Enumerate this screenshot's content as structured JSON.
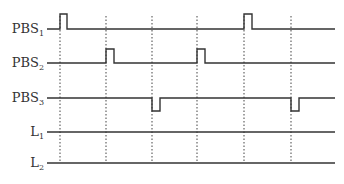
{
  "diagram": {
    "type": "timing_diagram",
    "line_color": "#333333",
    "time_markers_x": [
      60,
      106,
      152,
      197,
      244,
      291
    ],
    "grid_bottom_y": 163,
    "signals": [
      {
        "name": "PBS",
        "sub": "1",
        "base_y": 29,
        "kind": "pulse_high",
        "amplitude": 15,
        "pulses": [
          [
            60,
            67
          ],
          [
            244,
            252
          ]
        ]
      },
      {
        "name": "PBS",
        "sub": "2",
        "base_y": 63,
        "kind": "pulse_high",
        "amplitude": 14,
        "pulses": [
          [
            106,
            114
          ],
          [
            197,
            205
          ]
        ]
      },
      {
        "name": "PBS",
        "sub": "3",
        "base_y": 98,
        "kind": "pulse_low",
        "amplitude": 13,
        "pulses": [
          [
            152,
            160
          ],
          [
            291,
            299
          ]
        ]
      },
      {
        "name": "L",
        "sub": "1",
        "base_y": 132,
        "kind": "flat",
        "amplitude": 0,
        "pulses": []
      },
      {
        "name": "L",
        "sub": "2",
        "base_y": 163,
        "kind": "flat",
        "amplitude": 0,
        "pulses": []
      }
    ],
    "x_start": 47,
    "x_end": 335
  }
}
